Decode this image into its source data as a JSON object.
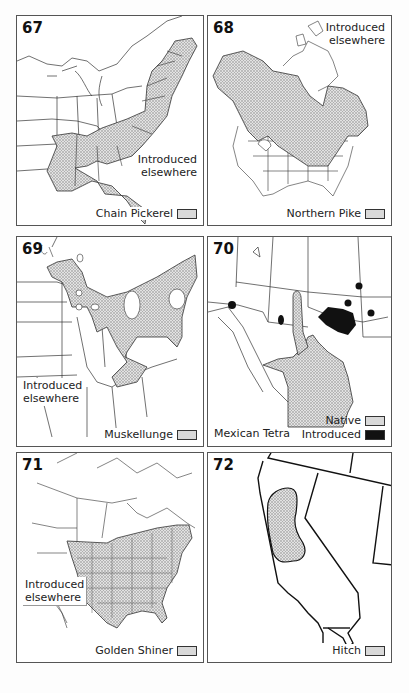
{
  "maps": [
    {
      "number": "67",
      "species": "Chain Pickerel",
      "note": "Introduced elsewhere",
      "note_lines": [
        "Introduced",
        "elsewhere"
      ],
      "legend": [
        {
          "label": "Chain Pickerel",
          "pattern": "stipple"
        }
      ],
      "region": "Eastern United States"
    },
    {
      "number": "68",
      "species": "Northern Pike",
      "note": "Introduced elsewhere",
      "note_lines": [
        "Introduced",
        "elsewhere"
      ],
      "legend": [
        {
          "label": "Northern Pike",
          "pattern": "stipple"
        }
      ],
      "region": "North America"
    },
    {
      "number": "69",
      "species": "Muskellunge",
      "note": "Introduced elsewhere",
      "note_lines": [
        "Introduced",
        "elsewhere"
      ],
      "legend": [
        {
          "label": "Muskellunge",
          "pattern": "stipple"
        }
      ],
      "region": "Great Lakes and upper Mississippi / Ohio basin"
    },
    {
      "number": "70",
      "species": "Mexican Tetra",
      "legend": [
        {
          "label": "Native",
          "pattern": "stipple"
        },
        {
          "label": "Introduced",
          "pattern": "black"
        }
      ],
      "region": "Southwestern United States and Mexico"
    },
    {
      "number": "71",
      "species": "Golden Shiner",
      "note": "Introduced elsewhere",
      "note_lines": [
        "Introduced",
        "elsewhere"
      ],
      "legend": [
        {
          "label": "Golden Shiner",
          "pattern": "stipple"
        }
      ],
      "region": "North America"
    },
    {
      "number": "72",
      "species": "Hitch",
      "legend": [
        {
          "label": "Hitch",
          "pattern": "stipple"
        }
      ],
      "region": "California"
    }
  ],
  "colors": {
    "border": "#555555",
    "range_fill": "#d6d6d6",
    "introduced_fill": "#111111",
    "state_lines": "#333333"
  }
}
